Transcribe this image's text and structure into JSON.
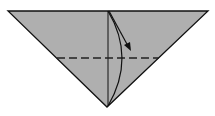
{
  "diagram": {
    "type": "origami-fold-step",
    "shape": "inverted-triangle",
    "colors": {
      "paper_fill": "#afafaf",
      "stroke": "#111111",
      "background": "#ffffff"
    },
    "triangle": {
      "points": [
        [
          8,
          11
        ],
        [
          208,
          11
        ],
        [
          107,
          107
        ]
      ]
    },
    "center_crease": {
      "x1": 108,
      "y1": 11,
      "x2": 108,
      "y2": 106
    },
    "valley_fold_line": {
      "x1": 57,
      "y1": 58,
      "x2": 159,
      "y2": 58,
      "dash": "8 4"
    },
    "fold_curve": {
      "path": "M108,11 Q136,58 108,106"
    },
    "arrow": {
      "path": "M109,11 L128,46",
      "head_points": [
        [
          131,
          51
        ],
        [
          124,
          45
        ],
        [
          130,
          42
        ]
      ]
    }
  }
}
